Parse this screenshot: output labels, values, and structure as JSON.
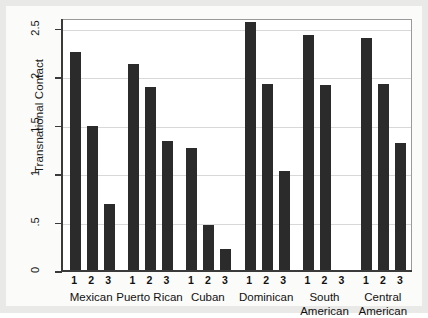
{
  "chart_data": {
    "type": "bar",
    "title": "",
    "subtitle": "",
    "xlabel": "",
    "ylabel": "Transnational Contact",
    "ylim": [
      0,
      2.6
    ],
    "grid": true,
    "legend": "none",
    "ytick_labels": [
      "0",
      ".5",
      "1",
      "1.5",
      "2",
      "2.5"
    ],
    "ytick_values": [
      0,
      0.5,
      1,
      1.5,
      2,
      2.5
    ],
    "group_categories": [
      "Mexican",
      "Puerto Rican",
      "Cuban",
      "Dominican",
      "South American",
      "Central American"
    ],
    "within_group_labels": [
      "1",
      "2",
      "3"
    ],
    "series": [
      {
        "name": "1",
        "values": [
          2.25,
          2.13,
          1.26,
          2.56,
          2.42,
          2.39
        ]
      },
      {
        "name": "2",
        "values": [
          1.49,
          1.89,
          0.46,
          1.92,
          1.91,
          1.92
        ]
      },
      {
        "name": "3",
        "values": [
          0.68,
          1.33,
          0.22,
          1.02,
          0.0,
          1.31
        ]
      }
    ],
    "bars": [
      {
        "group": "Mexican",
        "label": "1",
        "value": 2.25
      },
      {
        "group": "Mexican",
        "label": "2",
        "value": 1.49
      },
      {
        "group": "Mexican",
        "label": "3",
        "value": 0.68
      },
      {
        "group": "Puerto Rican",
        "label": "1",
        "value": 2.13
      },
      {
        "group": "Puerto Rican",
        "label": "2",
        "value": 1.89
      },
      {
        "group": "Puerto Rican",
        "label": "3",
        "value": 1.33
      },
      {
        "group": "Cuban",
        "label": "1",
        "value": 1.26
      },
      {
        "group": "Cuban",
        "label": "2",
        "value": 0.46
      },
      {
        "group": "Cuban",
        "label": "3",
        "value": 0.22
      },
      {
        "group": "Dominican",
        "label": "1",
        "value": 2.56
      },
      {
        "group": "Dominican",
        "label": "2",
        "value": 1.92
      },
      {
        "group": "Dominican",
        "label": "3",
        "value": 1.02
      },
      {
        "group": "South American",
        "label": "1",
        "value": 2.42
      },
      {
        "group": "South American",
        "label": "2",
        "value": 1.91
      },
      {
        "group": "South American",
        "label": "3",
        "value": 0.0
      },
      {
        "group": "Central American",
        "label": "1",
        "value": 2.39
      },
      {
        "group": "Central American",
        "label": "2",
        "value": 1.92
      },
      {
        "group": "Central American",
        "label": "3",
        "value": 1.31
      }
    ],
    "group_label_lines": [
      [
        "Mexican",
        ""
      ],
      [
        "Puerto Rican",
        ""
      ],
      [
        "Cuban",
        ""
      ],
      [
        "Dominican",
        ""
      ],
      [
        "South",
        "American"
      ],
      [
        "Central",
        "American"
      ]
    ],
    "colors": {
      "bar": "#2b2b2b",
      "grid": "#d8d8d8",
      "axis": "#3a3a3a",
      "plot_background": "#ffffff",
      "page_background": "#e9e9e7"
    }
  }
}
